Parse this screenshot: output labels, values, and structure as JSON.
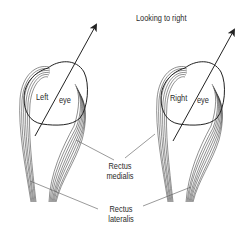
{
  "figure": {
    "title": "Looking to right",
    "eyes": [
      {
        "id": "left",
        "label_word1": "Left",
        "label_word2": "eye"
      },
      {
        "id": "right",
        "label_word1": "Right",
        "label_word2": "eye"
      }
    ],
    "muscle_labels": {
      "medialis": {
        "line1": "Rectus",
        "line2": "medialis"
      },
      "lateralis": {
        "line1": "Rectus",
        "line2": "lateralis"
      }
    },
    "colors": {
      "line": "#222222",
      "background": "#ffffff"
    }
  }
}
